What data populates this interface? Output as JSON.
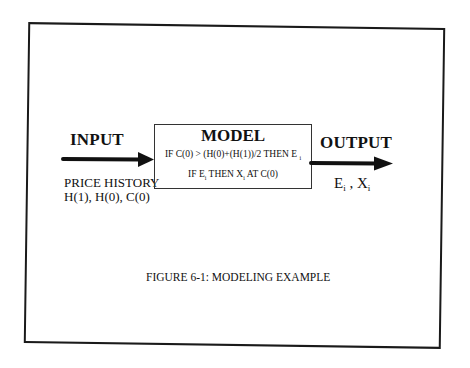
{
  "figure": {
    "caption": "FIGURE 6-1:  MODELING EXAMPLE"
  },
  "input": {
    "label": "INPUT",
    "description_line1": "PRICE HISTORY",
    "description_line2": "H(1), H(0), C(0)"
  },
  "model": {
    "title": "MODEL",
    "rule1_text": "IF C(0) > (H(0)+(H(1))/2 THEN E",
    "rule1_sub": "i",
    "rule2_part1": "IF E",
    "rule2_sub1": "i",
    "rule2_part2": " THEN X",
    "rule2_sub2": "i",
    "rule2_part3": " AT C(0)"
  },
  "output": {
    "label": "OUTPUT",
    "var1": "E",
    "var1_sub": "i",
    "separator": " , ",
    "var2": "X",
    "var2_sub": "i"
  },
  "colors": {
    "ink": "#111111",
    "background": "#ffffff"
  }
}
